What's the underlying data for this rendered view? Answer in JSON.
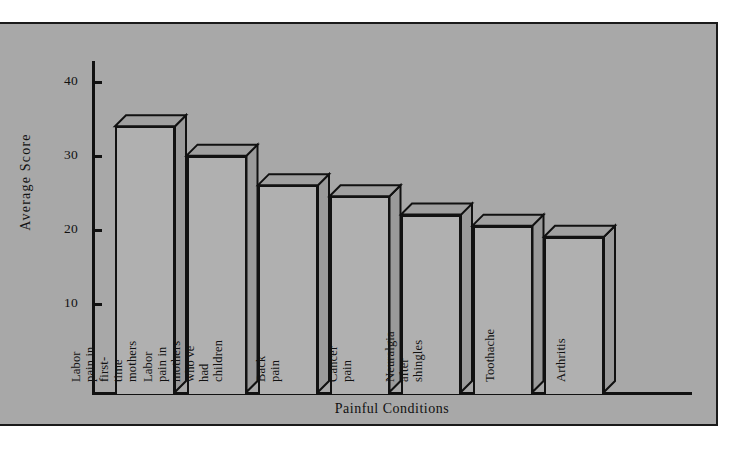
{
  "chart_data": {
    "type": "bar",
    "title": "",
    "xlabel": "Painful Conditions",
    "ylabel": "Average  Score",
    "ylim": [
      0,
      45
    ],
    "yticks": [
      10,
      20,
      30,
      40
    ],
    "ytick_labels": [
      "10",
      "20",
      "30",
      "40"
    ],
    "grid": false,
    "legend": "none",
    "style": "3d-shadowed bars, grey engraving",
    "categories": [
      "Labor pain in first-time mothers",
      "Labor pain in mothers who've had\nchildren",
      "Back pain",
      "Cancer pain",
      "Neuralgia after shingles",
      "Toothache",
      "Arthritis"
    ],
    "values": [
      34,
      30,
      26,
      24.5,
      22,
      20.5,
      19
    ]
  },
  "axes": {
    "y_title": "Average  Score",
    "x_title": "Painful Conditions",
    "tick_40": "40",
    "tick_30": "30",
    "tick_20": "20",
    "tick_10": "10"
  },
  "bars": [
    {
      "label": "Labor pain in first-time mothers",
      "value": 34
    },
    {
      "label": "Labor pain in mothers who've had\nchildren",
      "value": 30
    },
    {
      "label": "Back pain",
      "value": 26
    },
    {
      "label": "Cancer pain",
      "value": 24.5
    },
    {
      "label": "Neuralgia after shingles",
      "value": 22
    },
    {
      "label": "Toothache",
      "value": 20.5
    },
    {
      "label": "Arthritis",
      "value": 19
    }
  ],
  "colors": {
    "background": "#a8a8a8",
    "bar_face": "#b0b0b0",
    "bar_top": "#a0a0a0",
    "bar_side": "#9a9a9a",
    "ink": "#111111",
    "page": "#ffffff"
  }
}
